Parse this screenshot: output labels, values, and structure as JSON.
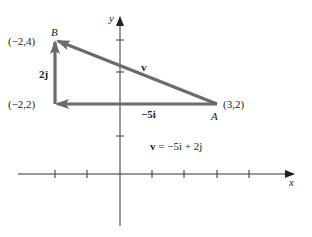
{
  "diagram": {
    "type": "vector-diagram",
    "axes": {
      "x_label": "x",
      "y_label": "y",
      "x_ticks": [
        -2,
        -1,
        1,
        2,
        3,
        4
      ],
      "y_ticks": [
        1,
        2,
        3,
        4
      ]
    },
    "points": {
      "A": {
        "name": "A",
        "coords": "(3,2)"
      },
      "B": {
        "name": "B",
        "coords": "(−2,4)"
      },
      "C": {
        "coords": "(−2,2)"
      }
    },
    "vectors": {
      "v": {
        "label": "v",
        "from": "A",
        "to": "B"
      },
      "horizontal": {
        "label": "−5i",
        "from": "A",
        "to": "C"
      },
      "vertical": {
        "label": "2j",
        "from": "C",
        "to": "B"
      }
    },
    "equation": {
      "lhs": "v",
      "rhs": " = −5i + 2j"
    },
    "colors": {
      "axis": "#333333",
      "vector": "#6b6b6b"
    }
  }
}
